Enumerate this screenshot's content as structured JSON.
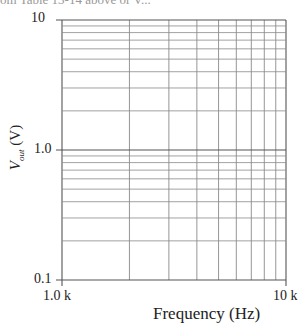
{
  "header": {
    "cropped_text": "om Table 13-14 above or V..."
  },
  "chart_data": {
    "type": "line",
    "title": "",
    "xlabel": "Frequency (Hz)",
    "ylabel_main": "V",
    "ylabel_sub": "out",
    "ylabel_unit": "(V)",
    "x_scale": "log",
    "y_scale": "log",
    "xlim": [
      1000,
      10000
    ],
    "ylim": [
      0.1,
      10
    ],
    "x_tick_labels": [
      "1.0 k",
      "10 k"
    ],
    "y_tick_labels": [
      "10",
      "1.0",
      "0.1"
    ],
    "x_gridlines": [
      1000,
      2000,
      3000,
      4000,
      5000,
      6000,
      7000,
      8000,
      9000,
      10000
    ],
    "y_gridlines": [
      0.1,
      0.2,
      0.3,
      0.4,
      0.5,
      0.6,
      0.7,
      0.8,
      0.9,
      1,
      2,
      3,
      4,
      5,
      6,
      7,
      8,
      9,
      10
    ],
    "grid": true,
    "series": [],
    "legend": null
  },
  "colors": {
    "grid": "#8a8a8a",
    "axis": "#555555",
    "text": "#222222"
  }
}
